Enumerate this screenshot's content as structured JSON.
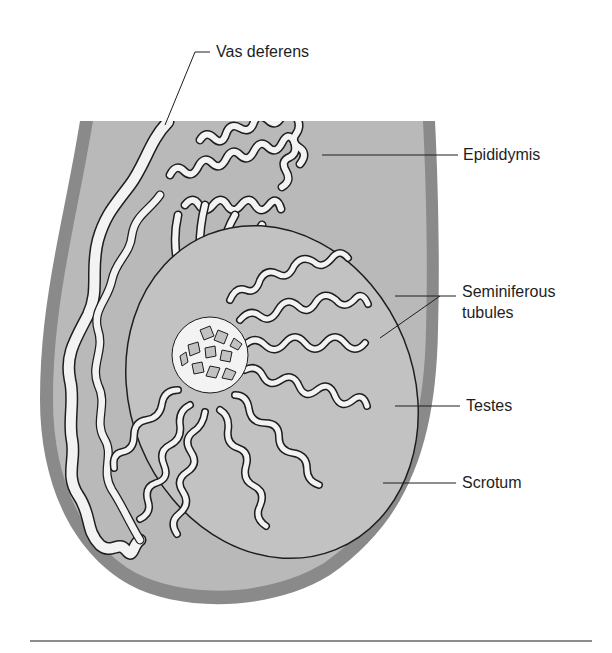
{
  "figure": {
    "type": "anatomical-diagram",
    "colors": {
      "background": "#ffffff",
      "scrotum_wall": "#8a8a8a",
      "scrotum_interior": "#b9b9b9",
      "testes_fill": "#c2c2c2",
      "tubule_fill": "#f3f3f3",
      "outline": "#1e1e1e",
      "leader_line": "#1e1e1e",
      "bottom_rule": "#8c8c8c"
    }
  },
  "labels": {
    "vas_deferens": "Vas deferens",
    "epididymis": "Epididymis",
    "seminiferous_line1": "Seminiferous",
    "seminiferous_line2": "tubules",
    "testes": "Testes",
    "scrotum": "Scrotum"
  }
}
